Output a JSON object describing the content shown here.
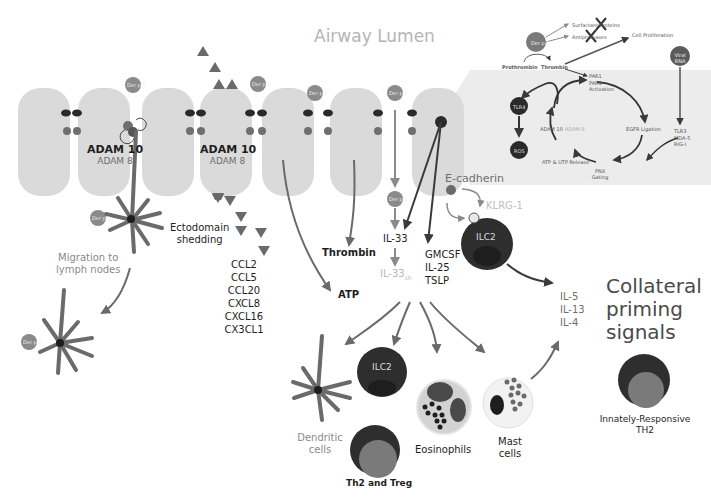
{
  "title": "Airway Lumen",
  "colors": {
    "cell": "#dadada",
    "inset_bg": "#ececec",
    "arrow": "#6a6a6a",
    "dark_cell": "#2e2e2e",
    "mid_cell": "#808080",
    "light_text": "#b8b8b8",
    "der_p1": "#8a8a8a"
  },
  "epithelium": {
    "adam_left": {
      "primary": "ADAM 10",
      "secondary": "ADAM 8"
    },
    "adam_center": {
      "primary": "ADAM 10",
      "secondary": "ADAM 8"
    },
    "allergen_label": "Der p 1"
  },
  "labels": {
    "ectodomain": [
      "Ectodomain",
      "shedding"
    ],
    "chemokines": [
      "CCL2",
      "CCL5",
      "CCL20",
      "CXCL8",
      "CXCL16",
      "CX3CL1"
    ],
    "migration": [
      "Migration to",
      "lymph nodes"
    ],
    "thrombin": "Thrombin",
    "atp": "ATP",
    "il33": "IL-33",
    "il33sh": "IL-33",
    "il33sh_sub": "sh",
    "cytokines": [
      "GMCSF",
      "IL-25",
      "TSLP"
    ],
    "e_cadherin": "E-cadherin",
    "klrg1": "KLRG-1",
    "ilc2": "ILC2",
    "th2_cytokines": [
      "IL-5",
      "IL-13",
      "IL-4"
    ],
    "collateral": [
      "Collateral",
      "priming",
      "signals"
    ],
    "innate_th2": [
      "Innately-Responsive",
      "TH2"
    ]
  },
  "targets": {
    "dendritic": [
      "Dendritic",
      "cells"
    ],
    "ilc2": "ILC2",
    "th2_treg": "Th2 and Treg",
    "eosinophils": "Eosinophils",
    "mast": [
      "Mast",
      "cells"
    ]
  },
  "inset": {
    "der_p1": "Der p 1",
    "surfactant": "Surfactant Proteins",
    "antiproteases": "Antiproteases",
    "cell_proliferation": "Cell Proliferation",
    "viral_rna": [
      "Viral",
      "RNA"
    ],
    "prothrombin": "Prothrombin",
    "thrombin": "Thrombin",
    "par": [
      "PAR1",
      "PAR4",
      "Activation"
    ],
    "tlr4": "TLR4",
    "ros": "ROS",
    "adam10": "ADAM 10",
    "adam8": "ADAM 8",
    "egfr": "EGFR Ligation",
    "tlr3": [
      "TLR3",
      "MDA-5",
      "RIG-I"
    ],
    "atp_utp": "ATP & UTP Release",
    "pnx": [
      "PNX",
      "Gating"
    ]
  }
}
